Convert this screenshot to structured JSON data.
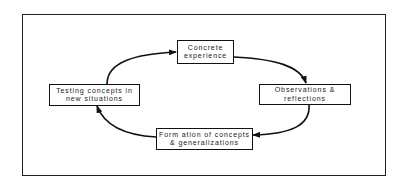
{
  "diagram": {
    "type": "cycle",
    "colors": {
      "stroke": "#111111",
      "text": "#222222",
      "background": "#ffffff"
    },
    "nodes": [
      {
        "id": "concrete",
        "lines": [
          "Concrete",
          "experience"
        ]
      },
      {
        "id": "observations",
        "lines": [
          "Observations &",
          "reflections"
        ]
      },
      {
        "id": "formation",
        "lines": [
          "Form ation of concepts",
          "& generalizations"
        ]
      },
      {
        "id": "testing",
        "lines": [
          "Testing concepts in",
          "new situations"
        ]
      }
    ],
    "edges": [
      {
        "from": "testing",
        "to": "concrete"
      },
      {
        "from": "concrete",
        "to": "observations"
      },
      {
        "from": "observations",
        "to": "formation"
      },
      {
        "from": "formation",
        "to": "testing"
      }
    ]
  }
}
